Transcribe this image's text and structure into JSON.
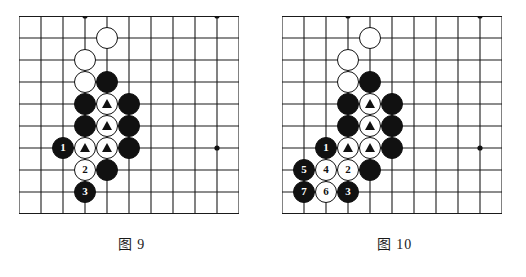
{
  "figures": [
    {
      "id": "figure-9",
      "caption": "图 9",
      "board": {
        "cols": 11,
        "rows": 10,
        "cell": 22,
        "line_color": "#1a1a1a",
        "edge_color": "#111111",
        "star_points": [
          [
            3,
            0
          ],
          [
            9,
            0
          ],
          [
            9,
            6
          ]
        ],
        "edges": {
          "top": true,
          "bottom": true,
          "left": false,
          "right": false
        }
      },
      "stones": [
        {
          "col": 4,
          "row": 1,
          "color": "white",
          "mark": "none",
          "label": ""
        },
        {
          "col": 3,
          "row": 2,
          "color": "white",
          "mark": "none",
          "label": ""
        },
        {
          "col": 3,
          "row": 3,
          "color": "white",
          "mark": "none",
          "label": ""
        },
        {
          "col": 4,
          "row": 3,
          "color": "black",
          "mark": "none",
          "label": ""
        },
        {
          "col": 3,
          "row": 4,
          "color": "black",
          "mark": "none",
          "label": ""
        },
        {
          "col": 4,
          "row": 4,
          "color": "white",
          "mark": "triangle",
          "label": ""
        },
        {
          "col": 5,
          "row": 4,
          "color": "black",
          "mark": "none",
          "label": ""
        },
        {
          "col": 3,
          "row": 5,
          "color": "black",
          "mark": "none",
          "label": ""
        },
        {
          "col": 4,
          "row": 5,
          "color": "white",
          "mark": "triangle",
          "label": ""
        },
        {
          "col": 5,
          "row": 5,
          "color": "black",
          "mark": "none",
          "label": ""
        },
        {
          "col": 2,
          "row": 6,
          "color": "black",
          "mark": "number",
          "label": "1"
        },
        {
          "col": 3,
          "row": 6,
          "color": "white",
          "mark": "triangle",
          "label": ""
        },
        {
          "col": 4,
          "row": 6,
          "color": "white",
          "mark": "triangle",
          "label": ""
        },
        {
          "col": 5,
          "row": 6,
          "color": "black",
          "mark": "none",
          "label": ""
        },
        {
          "col": 3,
          "row": 7,
          "color": "white",
          "mark": "number",
          "label": "2"
        },
        {
          "col": 4,
          "row": 7,
          "color": "black",
          "mark": "none",
          "label": ""
        },
        {
          "col": 3,
          "row": 8,
          "color": "black",
          "mark": "number",
          "label": "3"
        }
      ]
    },
    {
      "id": "figure-10",
      "caption": "图 10",
      "board": {
        "cols": 11,
        "rows": 10,
        "cell": 22,
        "line_color": "#1a1a1a",
        "edge_color": "#111111",
        "star_points": [
          [
            3,
            0
          ],
          [
            9,
            0
          ],
          [
            9,
            6
          ]
        ],
        "edges": {
          "top": true,
          "bottom": true,
          "left": false,
          "right": false
        }
      },
      "stones": [
        {
          "col": 4,
          "row": 1,
          "color": "white",
          "mark": "none",
          "label": ""
        },
        {
          "col": 3,
          "row": 2,
          "color": "white",
          "mark": "none",
          "label": ""
        },
        {
          "col": 3,
          "row": 3,
          "color": "white",
          "mark": "none",
          "label": ""
        },
        {
          "col": 4,
          "row": 3,
          "color": "black",
          "mark": "none",
          "label": ""
        },
        {
          "col": 3,
          "row": 4,
          "color": "black",
          "mark": "none",
          "label": ""
        },
        {
          "col": 4,
          "row": 4,
          "color": "white",
          "mark": "triangle",
          "label": ""
        },
        {
          "col": 5,
          "row": 4,
          "color": "black",
          "mark": "none",
          "label": ""
        },
        {
          "col": 3,
          "row": 5,
          "color": "black",
          "mark": "none",
          "label": ""
        },
        {
          "col": 4,
          "row": 5,
          "color": "white",
          "mark": "triangle",
          "label": ""
        },
        {
          "col": 5,
          "row": 5,
          "color": "black",
          "mark": "none",
          "label": ""
        },
        {
          "col": 2,
          "row": 6,
          "color": "black",
          "mark": "number",
          "label": "1"
        },
        {
          "col": 3,
          "row": 6,
          "color": "white",
          "mark": "triangle",
          "label": ""
        },
        {
          "col": 4,
          "row": 6,
          "color": "white",
          "mark": "triangle",
          "label": ""
        },
        {
          "col": 5,
          "row": 6,
          "color": "black",
          "mark": "none",
          "label": ""
        },
        {
          "col": 1,
          "row": 7,
          "color": "black",
          "mark": "number",
          "label": "5"
        },
        {
          "col": 2,
          "row": 7,
          "color": "white",
          "mark": "number",
          "label": "4"
        },
        {
          "col": 3,
          "row": 7,
          "color": "white",
          "mark": "number",
          "label": "2"
        },
        {
          "col": 4,
          "row": 7,
          "color": "black",
          "mark": "none",
          "label": ""
        },
        {
          "col": 1,
          "row": 8,
          "color": "black",
          "mark": "number",
          "label": "7"
        },
        {
          "col": 2,
          "row": 8,
          "color": "white",
          "mark": "number",
          "label": "6"
        },
        {
          "col": 3,
          "row": 8,
          "color": "black",
          "mark": "number",
          "label": "3"
        }
      ]
    }
  ]
}
